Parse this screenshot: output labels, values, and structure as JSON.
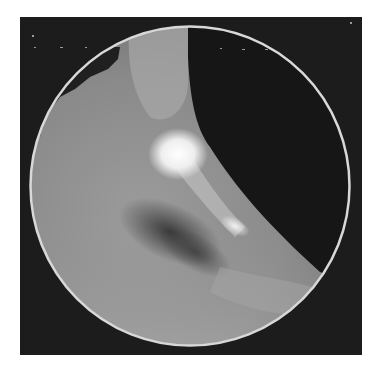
{
  "image": {
    "description": "Grayscale endoscopic-style photograph in a circular field of view on a dark square background",
    "frame": {
      "x": 20,
      "y": 17,
      "width": 342,
      "height": 338,
      "color": "#1c1c1c"
    },
    "circle": {
      "cx": 170,
      "cy": 169,
      "r": 160,
      "rim_color": "#d8d8d8"
    },
    "colors": {
      "tissue_light": "#9a9a9a",
      "tissue_mid": "#7a7a7a",
      "shadow": "#3a3a3a",
      "lumen": "#161616",
      "highlight": "#f4f4f4"
    }
  }
}
